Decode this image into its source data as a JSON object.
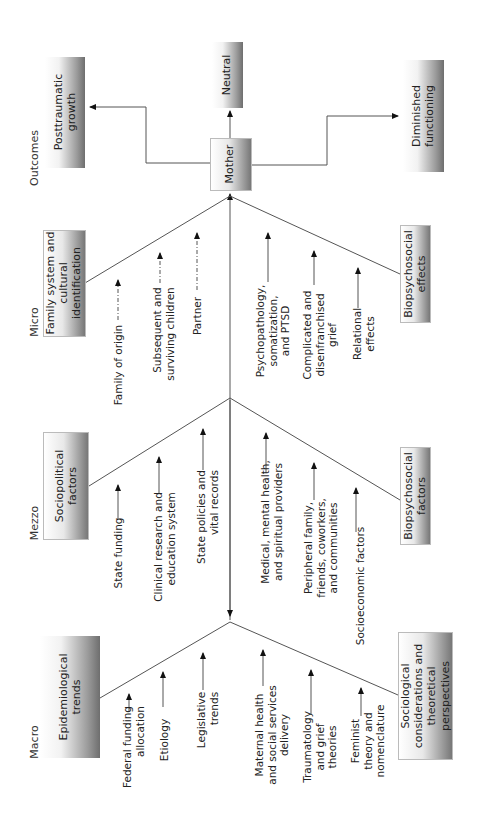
{
  "levels": {
    "macro": "Macro",
    "mezzo": "Mezzo",
    "micro": "Micro",
    "outcomes": "Outcomes"
  },
  "center": {
    "label": "Mother"
  },
  "outcomes": {
    "posttraumatic_growth": "Posttraumatic\ngrowth",
    "neutral": "Neutral",
    "diminished_functioning": "Diminished\nfunctioning"
  },
  "macro": {
    "upper_category": "Epidemiological\ntrends",
    "upper_items": [
      "Federal funding\nallocation",
      "Etiology",
      "Legislative\ntrends"
    ],
    "lower_category": "Sociological\nconsiderations and\ntheoretical\nperspectives",
    "lower_items": [
      "Maternal health\nand social services\ndelivery",
      "Traumatology\nand grief\ntheories",
      "Feminist\ntheory and\nnomenclature"
    ]
  },
  "mezzo": {
    "upper_category": "Sociopolitical\nfactors",
    "upper_items": [
      "State funding",
      "Clinical research and\neducation system",
      "State policies and\nvital records"
    ],
    "lower_category": "Biopsychosocial\nfactors",
    "lower_items": [
      "Medical, mental health,\nand spiritual providers",
      "Peripheral family,\nfriends, coworkers,\nand communities",
      "Socioeconomic factors"
    ]
  },
  "micro": {
    "upper_category": "Family system and\ncultural\nidentification",
    "upper_items": [
      "Family of origin",
      "Subsequent and\nsurviving children",
      "Partner"
    ],
    "lower_category": "Biopsychosocial\neffects",
    "lower_items": [
      "Psychopathology,\nsomatization,\nand PTSD",
      "Complicated and\ndisenfranchised\ngrief",
      "Relational\neffects"
    ]
  }
}
